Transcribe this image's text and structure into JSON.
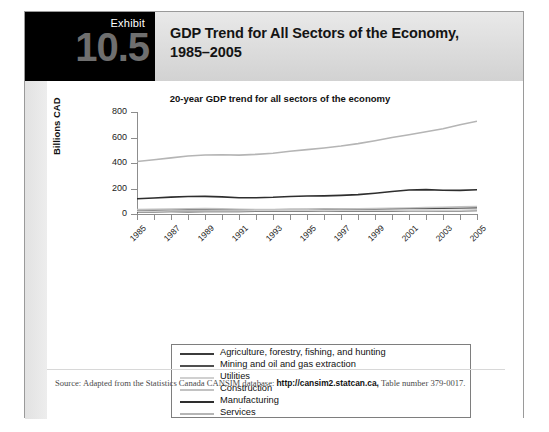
{
  "exhibit": {
    "label": "Exhibit",
    "number": "10.5",
    "title": "GDP Trend for All Sectors of the Economy, 1985–2005"
  },
  "source": {
    "prefix": "Source: Adapted from the Statistics Canada CANSIM database: ",
    "url": "http://cansim2.statcan.ca,",
    "suffix": " Table number 379-0017."
  },
  "chart_data": {
    "type": "line",
    "title": "20-year GDP trend for all sectors of the economy",
    "xlabel": "",
    "ylabel": "Billions CAD",
    "ylim": [
      0,
      800
    ],
    "yticks": [
      0,
      200,
      400,
      600,
      800
    ],
    "grid": false,
    "legend_position": "below",
    "x": [
      1985,
      1986,
      1987,
      1988,
      1989,
      1990,
      1991,
      1992,
      1993,
      1994,
      1995,
      1996,
      1997,
      1998,
      1999,
      2000,
      2001,
      2002,
      2003,
      2004,
      2005
    ],
    "xtick_labels": [
      "1985",
      "1987",
      "1989",
      "1991",
      "1993",
      "1995",
      "1997",
      "1999",
      "2001",
      "2003",
      "2005"
    ],
    "series": [
      {
        "name": "Agriculture, forestry, fishing, and hunting",
        "color": "#3b3b3b",
        "width": 1.4,
        "values": [
          18,
          18,
          19,
          18,
          19,
          20,
          20,
          21,
          21,
          22,
          22,
          23,
          23,
          23,
          24,
          24,
          25,
          25,
          26,
          26,
          27
        ]
      },
      {
        "name": "Mining and oil and gas extraction",
        "color": "#4f4f4f",
        "width": 1.4,
        "values": [
          30,
          29,
          30,
          31,
          31,
          32,
          32,
          33,
          34,
          35,
          36,
          37,
          38,
          38,
          39,
          41,
          42,
          43,
          45,
          46,
          48
        ]
      },
      {
        "name": "Utilities",
        "color": "#d0d0d0",
        "width": 1.4,
        "values": [
          22,
          22,
          23,
          23,
          24,
          24,
          24,
          25,
          25,
          26,
          26,
          26,
          27,
          27,
          27,
          28,
          28,
          28,
          29,
          29,
          30
        ]
      },
      {
        "name": "Construction",
        "color": "#c2c2c2",
        "width": 1.4,
        "values": [
          36,
          38,
          40,
          42,
          43,
          41,
          38,
          36,
          35,
          36,
          37,
          38,
          40,
          42,
          44,
          46,
          48,
          51,
          54,
          57,
          60
        ]
      },
      {
        "name": "Manufacturing",
        "color": "#2e2e2e",
        "width": 1.6,
        "values": [
          120,
          126,
          132,
          137,
          138,
          134,
          128,
          128,
          131,
          137,
          141,
          142,
          146,
          152,
          163,
          176,
          188,
          191,
          186,
          185,
          190
        ]
      },
      {
        "name": "Services",
        "color": "#b5b5b5",
        "width": 1.6,
        "values": [
          412,
          425,
          440,
          455,
          463,
          465,
          462,
          468,
          477,
          492,
          505,
          518,
          533,
          552,
          575,
          600,
          622,
          645,
          668,
          700,
          728
        ]
      }
    ]
  }
}
